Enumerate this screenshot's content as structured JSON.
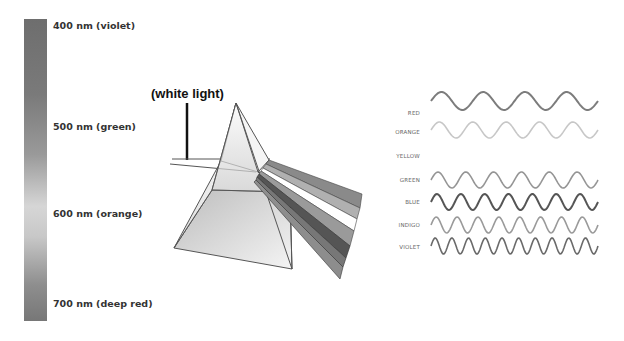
{
  "spectrum": {
    "labels": [
      {
        "text": "400 nm (violet)",
        "top": 20
      },
      {
        "text": "500 nm (green)",
        "top": 121
      },
      {
        "text": "600 nm (orange)",
        "top": 208
      },
      {
        "text": "700 nm (deep red)",
        "top": 298
      }
    ]
  },
  "prism": {
    "label": "(white light)"
  },
  "waves": {
    "items": [
      {
        "name": "RED",
        "label_top": 110,
        "y": 101,
        "periods": 4,
        "color": "#7c7c7c",
        "width": 2
      },
      {
        "name": "ORANGE",
        "label_top": 129,
        "y": 130,
        "periods": 5,
        "color": "#c7c7c7",
        "width": 1.6
      },
      {
        "name": "YELLOW",
        "label_top": 153,
        "y": null,
        "periods": 0,
        "color": "#ffffff",
        "width": 0
      },
      {
        "name": "GREEN",
        "label_top": 177,
        "y": 180,
        "periods": 6,
        "color": "#959595",
        "width": 1.6
      },
      {
        "name": "BLUE",
        "label_top": 199,
        "y": 202,
        "periods": 7,
        "color": "#555555",
        "width": 2
      },
      {
        "name": "INDIGO",
        "label_top": 222,
        "y": 225,
        "periods": 8,
        "color": "#9a9a9a",
        "width": 1.6
      },
      {
        "name": "VIOLET",
        "label_top": 244,
        "y": 246,
        "periods": 10,
        "color": "#6a6a6a",
        "width": 1.6
      }
    ]
  }
}
